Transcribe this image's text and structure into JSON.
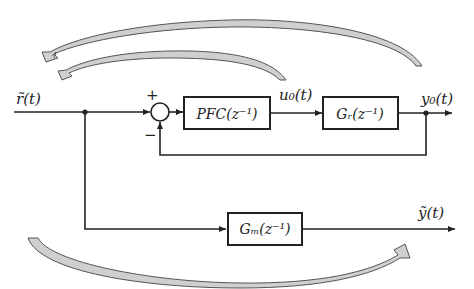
{
  "diagram": {
    "type": "block-diagram",
    "signals": {
      "input": "r̃(t)",
      "control": "u₀(t)",
      "plant_output": "y₀(t)",
      "model_output": "ỹ(t)"
    },
    "junction": {
      "plus": "+",
      "minus": "−"
    },
    "blocks": {
      "controller": "PFC(z⁻¹)",
      "plant": "Gᵣ(z⁻¹)",
      "model": "Gₘ(z⁻¹)"
    },
    "curved_arrows": [
      {
        "from": "y0 output",
        "to": "input r",
        "position": "top-outer"
      },
      {
        "from": "u0 output",
        "to": "input r",
        "position": "top-inner"
      },
      {
        "from": "input r",
        "to": "model output",
        "position": "bottom"
      }
    ],
    "colors": {
      "line": "#222222",
      "arrow_fill": "#cfcfcf",
      "background": "#ffffff"
    }
  }
}
